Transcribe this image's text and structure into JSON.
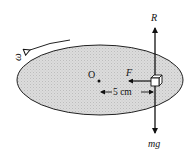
{
  "diagram": {
    "type": "physics-free-body",
    "labels": {
      "center": "O",
      "angular_velocity": "ω",
      "friction": "F",
      "normal_reaction": "R",
      "weight": "mg",
      "distance": "5 cm"
    },
    "colors": {
      "disc_fill": "#d6d6d6",
      "outline": "#111111"
    }
  }
}
